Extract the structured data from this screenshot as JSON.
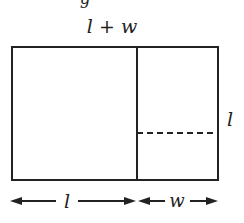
{
  "diagram": {
    "top_label": "l + w",
    "right_label": "l",
    "bottom_left_label": "l",
    "bottom_right_label": "w",
    "partial_caption": "g",
    "line_color": "#222222"
  }
}
